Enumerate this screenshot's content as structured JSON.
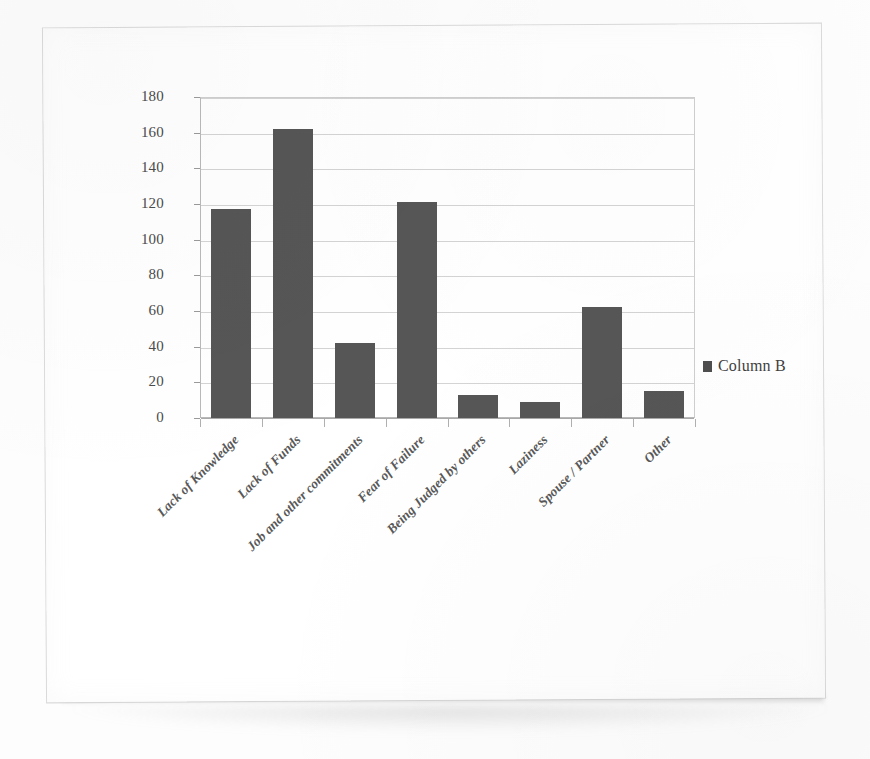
{
  "chart_data": {
    "type": "bar",
    "title": "",
    "subtitle": "",
    "xlabel": "",
    "ylabel": "",
    "categories": [
      "Lack of Knowledge",
      "Lack of Funds",
      "Job and other commitments",
      "Fear of Failure",
      "Being Judged by others",
      "Laziness",
      "Spouse / Partner",
      "Other"
    ],
    "values": [
      117,
      162,
      42,
      121,
      13,
      9,
      62,
      15
    ],
    "series": [
      {
        "name": "Column B",
        "values": [
          117,
          162,
          42,
          121,
          13,
          9,
          62,
          15
        ],
        "color": "#565656"
      }
    ],
    "ylim": [
      0,
      180
    ],
    "ytick_values": [
      0,
      20,
      40,
      60,
      80,
      100,
      120,
      140,
      160,
      180
    ],
    "ytick_labels": [
      "0",
      "20",
      "40",
      "60",
      "80",
      "100",
      "120",
      "140",
      "160",
      "180"
    ],
    "grid": "horizontal",
    "legend": {
      "position": "right",
      "entries": [
        {
          "label": "Column B",
          "color": "#565656"
        }
      ]
    },
    "bar_color": "#565656",
    "gridline_color": "#d4d4d4",
    "axis_color": "#a9a9a9",
    "label_color": "#585858",
    "plot_background": "#ffffff",
    "page_background": "#ffffff"
  }
}
